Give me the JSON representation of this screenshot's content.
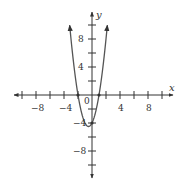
{
  "chart_data": {
    "type": "line",
    "title": "",
    "xlabel": "x",
    "ylabel": "y",
    "xlim": [
      -10,
      10
    ],
    "ylim": [
      -10,
      10
    ],
    "grid": false,
    "x_ticks": [
      -10,
      -8,
      -6,
      -4,
      -2,
      2,
      4,
      6,
      8,
      10
    ],
    "y_ticks": [
      -10,
      -8,
      -6,
      -4,
      -2,
      2,
      4,
      6,
      8,
      10
    ],
    "x_tick_labels": [
      "-8",
      "-4",
      "4",
      "8"
    ],
    "y_tick_labels": [
      "8",
      "4",
      "-4",
      "-8"
    ],
    "origin_label": "0",
    "series": [
      {
        "name": "parabola",
        "equation": "y = 2x^2 + 2x - 4",
        "roots": [
          -2,
          1
        ],
        "y_intercept": -4,
        "vertex": [
          -0.5,
          -4.5
        ],
        "x": [
          -3.19,
          -3,
          -2.5,
          -2,
          -1.5,
          -1,
          -0.5,
          0,
          0.5,
          1,
          1.5,
          2,
          2.19
        ],
        "y": [
          10,
          8,
          3.5,
          0,
          -2.5,
          -4,
          -4.5,
          -4,
          -2.5,
          0,
          3.5,
          8,
          10
        ]
      }
    ],
    "points": [
      [
        -2,
        0
      ],
      [
        1,
        0
      ],
      [
        0,
        -4
      ]
    ]
  },
  "labels": {
    "x_axis": "x",
    "y_axis": "y",
    "origin": "0",
    "x_neg8": "−8",
    "x_neg4": "−4",
    "x_pos4": "4",
    "x_pos8": "8",
    "y_pos8": "8",
    "y_pos4": "4",
    "y_neg4": "−4",
    "y_neg8": "−8"
  },
  "colors": {
    "axis": "#333333",
    "curve": "#555555"
  }
}
